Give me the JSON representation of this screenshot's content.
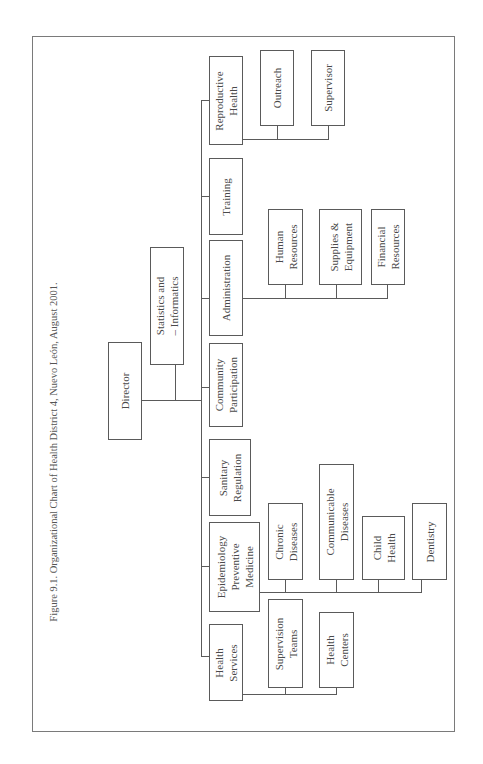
{
  "caption": "Figure 9.1. Organizational Chart of Health District 4, Nuevo León, August 2001.",
  "chart": {
    "root": "Director",
    "staff": "Statistics and\n– Informatics",
    "departments": [
      {
        "name": "Reproductive\nHealth",
        "children": [
          "Outreach",
          "Supervisor"
        ]
      },
      {
        "name": "Training",
        "children": []
      },
      {
        "name": "Administration",
        "children": [
          "Human\nResources",
          "Supplies &\nEquipment",
          "Financial\nResources"
        ]
      },
      {
        "name": "Community\nParticipation",
        "children": []
      },
      {
        "name": "Sanitary\nRegulation",
        "children": []
      },
      {
        "name": "Epidemiology\nPreventive\nMedicine",
        "children": [
          "Chronic\nDiseases",
          "Communicable\nDiseases",
          "Child\nHealth",
          "Dentistry"
        ]
      },
      {
        "name": "Health\nServices",
        "children": [
          "Supervision\nTeams",
          "Health\nCenters"
        ]
      }
    ]
  }
}
